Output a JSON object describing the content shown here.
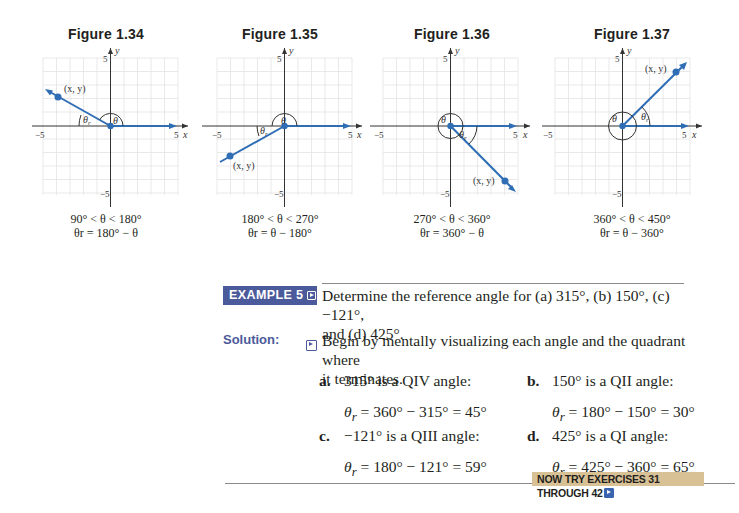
{
  "figures": [
    {
      "title": "Figure 1.34",
      "range_caption": "90° < θ < 180°",
      "formula_caption": "θr = 180° − θ",
      "axis": {
        "x_label": "x",
        "y_label": "y",
        "x_min_label": "−5",
        "x_max_label": "5",
        "y_max_label": "5",
        "y_min_label": "−5"
      },
      "point_label": "(x, y)",
      "angle_label": "θ",
      "ref_angle_label": "θr",
      "terminal_point": [
        -4,
        2.2
      ]
    },
    {
      "title": "Figure 1.35",
      "range_caption": "180° < θ < 270°",
      "formula_caption": "θr = θ − 180°",
      "axis": {
        "x_label": "x",
        "y_label": "y",
        "x_min_label": "−5",
        "x_max_label": "5",
        "y_max_label": "5",
        "y_min_label": "−5"
      },
      "point_label": "(x, y)",
      "angle_label": "θ",
      "ref_angle_label": "θr",
      "terminal_point": [
        -4,
        -2.2
      ]
    },
    {
      "title": "Figure 1.36",
      "range_caption": "270° < θ < 360°",
      "formula_caption": "θr = 360° − θ",
      "axis": {
        "x_label": "x",
        "y_label": "y",
        "x_min_label": "−5",
        "x_max_label": "5",
        "y_max_label": "5",
        "y_min_label": "−5"
      },
      "point_label": "(x, y)",
      "angle_label": "θ",
      "ref_angle_label": "θr",
      "terminal_point": [
        4,
        -4
      ]
    },
    {
      "title": "Figure 1.37",
      "range_caption": "360° < θ < 450°",
      "formula_caption": "θr = θ − 360°",
      "axis": {
        "x_label": "x",
        "y_label": "y",
        "x_min_label": "−5",
        "x_max_label": "5",
        "y_max_label": "5",
        "y_min_label": "−5"
      },
      "point_label": "(x, y)",
      "angle_label": "θ",
      "ref_angle_label": "θr",
      "terminal_point": [
        4,
        4
      ]
    }
  ],
  "example": {
    "badge": "EXAMPLE 5",
    "prompt_line1": "Determine the reference angle for (a) 315°, (b) 150°, (c) −121°,",
    "prompt_line2": "and (d) 425°."
  },
  "solution": {
    "label": "Solution:",
    "intro_line1": "Begin by mentally visualizing each angle and the quadrant where",
    "intro_line2": "it terminates.",
    "parts": [
      {
        "letter": "a.",
        "statement": "315° is a QIV angle:",
        "equation": "= 360° − 315° = 45°"
      },
      {
        "letter": "b.",
        "statement": "150° is a QII angle:",
        "equation": "= 180° − 150° = 30°"
      },
      {
        "letter": "c.",
        "statement": "−121° is a QIII angle:",
        "equation": "= 180° − 121° = 59°"
      },
      {
        "letter": "d.",
        "statement": "425° is a QI angle:",
        "equation": "= 425° − 360° = 65°"
      }
    ],
    "theta_symbol": "θ",
    "theta_sub": "r"
  },
  "now_try": {
    "label": "NOW TRY EXERCISES 31 THROUGH 42"
  },
  "colors": {
    "ray": "#2f6db5",
    "badge": "#4b5a9a",
    "now_try_bg": "#d9c196",
    "grid": "#e2e2e2"
  }
}
